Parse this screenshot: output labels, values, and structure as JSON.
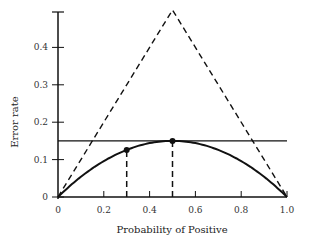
{
  "chart_data": {
    "type": "line",
    "title": "",
    "xlabel": "Probability of Positive",
    "ylabel": "Error rate",
    "xlim": [
      0,
      1.0
    ],
    "ylim": [
      0,
      0.5
    ],
    "xticks": [
      "0",
      "0.2",
      "0.4",
      "0.6",
      "0.8",
      "1.0"
    ],
    "yticks": [
      "0",
      "0.1",
      "0.2",
      "0.3",
      "0.4"
    ],
    "grid": false,
    "legend": null,
    "series": [
      {
        "name": "triangle (dashed)",
        "style": "dashed",
        "x": [
          0,
          0.5,
          1.0
        ],
        "y": [
          0,
          0.5,
          0
        ]
      },
      {
        "name": "horizontal line",
        "style": "solid",
        "x": [
          0,
          1.0
        ],
        "y": [
          0.15,
          0.15
        ]
      },
      {
        "name": "curve",
        "style": "solid",
        "x": [
          0,
          0.1,
          0.2,
          0.3,
          0.4,
          0.5,
          0.6,
          0.7,
          0.8,
          0.9,
          1.0
        ],
        "y": [
          0,
          0.054,
          0.096,
          0.126,
          0.144,
          0.15,
          0.144,
          0.126,
          0.096,
          0.054,
          0
        ]
      }
    ],
    "points": [
      {
        "x": 0.3,
        "y": 0.126
      },
      {
        "x": 0.5,
        "y": 0.15
      }
    ],
    "vertical_dashed_lines": [
      {
        "x": 0.3,
        "y_top": 0.126
      },
      {
        "x": 0.5,
        "y_top": 0.15
      }
    ]
  }
}
